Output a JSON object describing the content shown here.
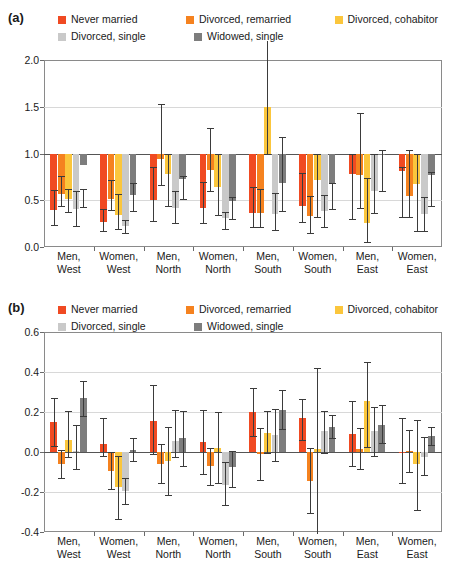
{
  "figure": {
    "panels": [
      {
        "id": "a",
        "letter": "(a)"
      },
      {
        "id": "b",
        "letter": "(b)"
      }
    ],
    "legend": {
      "items": [
        {
          "label": "Never married",
          "color": "#F04A22"
        },
        {
          "label": "Divorced, remarried",
          "color": "#F5821F"
        },
        {
          "label": "Divorced, cohabitor",
          "color": "#FBC63C"
        },
        {
          "label": "Divorced, single",
          "color": "#C9C9C9"
        },
        {
          "label": "Widowed, single",
          "color": "#7D7D7D"
        }
      ]
    }
  },
  "chart_data": [
    {
      "type": "bar",
      "panel": "a",
      "title": "",
      "xlabel": "",
      "ylabel": "",
      "ylim": [
        0.0,
        2.0
      ],
      "yticks": [
        "0.0",
        "0.5",
        "1.0",
        "1.5",
        "2.0"
      ],
      "ytick_values": [
        0.0,
        0.5,
        1.0,
        1.5,
        2.0
      ],
      "baseline": 1.0,
      "grid": true,
      "legend_position": "top",
      "categories": [
        "Men,\nWest",
        "Women,\nWest",
        "Men,\nNorth",
        "Women,\nNorth",
        "Men,\nSouth",
        "Women,\nSouth",
        "Men,\nEast",
        "Women,\nEast"
      ],
      "series": [
        {
          "name": "Never married",
          "color": "#F04A22",
          "values": [
            0.4,
            0.27,
            0.5,
            0.42,
            0.36,
            0.44,
            0.78,
            0.81
          ],
          "ci_low": [
            0.23,
            0.17,
            0.28,
            0.26,
            0.21,
            0.27,
            0.3,
            0.32
          ],
          "ci_high": [
            0.61,
            0.41,
            0.86,
            0.69,
            0.64,
            0.79,
            1.0,
            0.86
          ]
        },
        {
          "name": "Divorced, remarried",
          "color": "#F5821F",
          "values": [
            0.57,
            0.51,
            0.94,
            0.82,
            0.36,
            0.33,
            0.77,
            0.55
          ],
          "ci_low": [
            0.44,
            0.4,
            0.66,
            0.6,
            0.21,
            0.15,
            0.42,
            0.32
          ],
          "ci_high": [
            0.76,
            0.72,
            1.53,
            1.27,
            0.62,
            0.55,
            1.43,
            1.04
          ]
        },
        {
          "name": "Divorced, cohabitor",
          "color": "#FBC63C",
          "values": [
            0.51,
            0.34,
            0.78,
            0.64,
            1.5,
            0.72,
            0.26,
            0.67
          ],
          "ci_low": [
            0.37,
            0.19,
            0.44,
            0.34,
            1.0,
            0.32,
            0.05,
            0.17
          ],
          "ci_high": [
            0.62,
            0.57,
            1.0,
            1.0,
            2.2,
            1.0,
            0.74,
            1.0
          ]
        },
        {
          "name": "Divorced, single",
          "color": "#C9C9C9",
          "values": [
            0.41,
            0.22,
            0.42,
            0.31,
            0.35,
            0.38,
            0.6,
            0.35
          ],
          "ci_low": [
            0.22,
            0.15,
            0.26,
            0.19,
            0.18,
            0.21,
            0.36,
            0.17
          ],
          "ci_high": [
            0.6,
            0.29,
            0.6,
            0.37,
            0.58,
            0.56,
            1.0,
            0.53
          ]
        },
        {
          "name": "Widowed, single",
          "color": "#7D7D7D",
          "values": [
            0.88,
            0.56,
            0.73,
            0.49,
            0.68,
            0.67,
            1.0,
            0.77
          ],
          "ci_low": [
            0.43,
            0.39,
            0.51,
            0.3,
            0.39,
            0.41,
            0.6,
            0.44
          ],
          "ci_high": [
            0.62,
            0.68,
            0.76,
            0.53,
            1.18,
            0.68,
            1.04,
            0.8
          ]
        }
      ]
    },
    {
      "type": "bar",
      "panel": "b",
      "title": "",
      "xlabel": "",
      "ylabel": "",
      "ylim": [
        -0.4,
        0.6
      ],
      "yticks": [
        "-0.4",
        "-0.2",
        "0.0",
        "0.2",
        "0.4",
        "0.6"
      ],
      "ytick_values": [
        -0.4,
        -0.2,
        0.0,
        0.2,
        0.4,
        0.6
      ],
      "baseline": 0.0,
      "grid": true,
      "legend_position": "top",
      "categories": [
        "Men,\nWest",
        "Women,\nWest",
        "Men,\nNorth",
        "Women,\nNorth",
        "Men,\nSouth",
        "Women,\nSouth",
        "Men,\nEast",
        "Women,\nEast"
      ],
      "series": [
        {
          "name": "Never married",
          "color": "#F04A22",
          "values": [
            0.15,
            0.04,
            0.155,
            0.05,
            0.2,
            0.17,
            0.09,
            0.0
          ],
          "ci_low": [
            0.03,
            -0.02,
            -0.01,
            -0.11,
            0.08,
            0.06,
            -0.07,
            -0.155
          ],
          "ci_high": [
            0.27,
            0.17,
            0.335,
            0.21,
            0.32,
            0.265,
            0.255,
            0.17
          ]
        },
        {
          "name": "Divorced, remarried",
          "color": "#F5821F",
          "values": [
            -0.06,
            -0.095,
            -0.06,
            -0.07,
            -0.01,
            -0.145,
            0.015,
            0.005
          ],
          "ci_low": [
            -0.13,
            -0.185,
            -0.155,
            -0.165,
            -0.14,
            -0.305,
            -0.085,
            -0.1
          ],
          "ci_high": [
            0.01,
            0.0,
            0.04,
            0.02,
            0.12,
            0.02,
            0.12,
            0.11
          ]
        },
        {
          "name": "Divorced, cohabitor",
          "color": "#FBC63C",
          "values": [
            0.06,
            -0.175,
            -0.045,
            0.02,
            0.095,
            0.015,
            0.255,
            -0.06
          ],
          "ci_low": [
            -0.025,
            -0.335,
            -0.215,
            -0.155,
            -0.005,
            -0.41,
            0.025,
            -0.29
          ],
          "ci_high": [
            0.205,
            -0.02,
            0.125,
            0.2,
            0.205,
            0.42,
            0.45,
            0.16
          ]
        },
        {
          "name": "Divorced, single",
          "color": "#C9C9C9",
          "values": [
            0.005,
            -0.195,
            0.055,
            -0.165,
            0.085,
            0.105,
            0.105,
            -0.025
          ],
          "ci_low": [
            -0.085,
            -0.26,
            -0.025,
            -0.265,
            -0.045,
            -0.005,
            -0.02,
            -0.115
          ],
          "ci_high": [
            0.135,
            -0.13,
            0.21,
            -0.05,
            0.215,
            0.205,
            0.225,
            0.075
          ]
        },
        {
          "name": "Widowed, single",
          "color": "#7D7D7D",
          "values": [
            0.27,
            0.01,
            0.07,
            -0.075,
            0.21,
            0.125,
            0.135,
            0.08
          ],
          "ci_low": [
            0.18,
            -0.045,
            -0.07,
            -0.175,
            0.115,
            0.07,
            0.045,
            0.035
          ],
          "ci_high": [
            0.355,
            0.07,
            0.205,
            0.005,
            0.31,
            0.185,
            0.235,
            0.125
          ]
        }
      ]
    }
  ]
}
